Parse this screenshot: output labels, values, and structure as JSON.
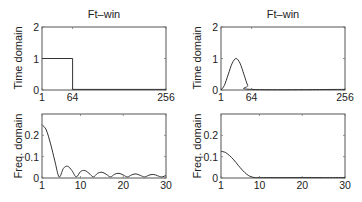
{
  "figure": {
    "columns": [
      {
        "title": "Ft–win"
      },
      {
        "title": "Ft–win"
      }
    ]
  },
  "chart_data": [
    {
      "id": "top-left",
      "type": "line",
      "title": "Ft–win",
      "xlabel": "",
      "ylabel": "Time domain",
      "xlim": [
        1,
        256
      ],
      "ylim": [
        0,
        2
      ],
      "xticks": [
        1,
        64,
        256
      ],
      "xtick_labels": [
        "1",
        "64",
        "256"
      ],
      "yticks": [
        0,
        1,
        2
      ],
      "ytick_labels": [
        "0",
        "1",
        "2"
      ],
      "grid": false,
      "series": [
        {
          "name": "rectangular window",
          "x": [
            1,
            64,
            64,
            256
          ],
          "y": [
            1,
            1,
            0.02,
            0.02
          ]
        }
      ]
    },
    {
      "id": "top-right",
      "type": "line",
      "title": "Ft–win",
      "xlabel": "",
      "ylabel": "Time domain",
      "xlim": [
        1,
        256
      ],
      "ylim": [
        0,
        2
      ],
      "xticks": [
        1,
        64,
        256
      ],
      "xtick_labels": [
        "1",
        "64",
        "256"
      ],
      "yticks": [
        0,
        1,
        2
      ],
      "ytick_labels": [
        "0",
        "1",
        "2"
      ],
      "grid": false,
      "series": [
        {
          "name": "hann window",
          "x": [
            1,
            8,
            16,
            24,
            32,
            40,
            48,
            56,
            64,
            256
          ],
          "y": [
            0.0,
            0.15,
            0.5,
            0.85,
            1.0,
            0.85,
            0.5,
            0.15,
            0.02,
            0.02
          ]
        }
      ]
    },
    {
      "id": "bottom-left",
      "type": "line",
      "title": "",
      "xlabel": "",
      "ylabel": "Freq. domain",
      "xlim": [
        1,
        30
      ],
      "ylim": [
        0,
        0.3
      ],
      "xticks": [
        1,
        10,
        20,
        30
      ],
      "xtick_labels": [
        "1",
        "10",
        "20",
        "30"
      ],
      "yticks": [
        0,
        0.1,
        0.2
      ],
      "ytick_labels": [
        "0",
        "0.1",
        "0.2"
      ],
      "grid": false,
      "series": [
        {
          "name": "rectangular spectrum",
          "x": [
            1,
            2,
            3,
            4,
            5,
            6,
            7,
            8,
            9,
            10,
            11,
            12,
            13,
            14,
            15,
            16,
            17,
            18,
            19,
            20,
            21,
            22,
            23,
            24,
            25,
            26,
            27,
            28,
            29,
            30
          ],
          "y": [
            0.25,
            0.225,
            0.16,
            0.08,
            0.005,
            0.045,
            0.055,
            0.035,
            0.005,
            0.03,
            0.035,
            0.022,
            0.005,
            0.022,
            0.027,
            0.018,
            0.005,
            0.018,
            0.022,
            0.014,
            0.005,
            0.015,
            0.019,
            0.012,
            0.005,
            0.013,
            0.017,
            0.011,
            0.005,
            0.012
          ]
        }
      ]
    },
    {
      "id": "bottom-right",
      "type": "line",
      "title": "",
      "xlabel": "",
      "ylabel": "Freq. domain",
      "xlim": [
        1,
        30
      ],
      "ylim": [
        0,
        0.3
      ],
      "xticks": [
        1,
        10,
        20,
        30
      ],
      "xtick_labels": [
        "1",
        "10",
        "20",
        "30"
      ],
      "yticks": [
        0,
        0.1,
        0.2
      ],
      "ytick_labels": [
        "0",
        "0.1",
        "0.2"
      ],
      "grid": false,
      "series": [
        {
          "name": "hann spectrum",
          "x": [
            1,
            2,
            3,
            4,
            5,
            6,
            7,
            8,
            9,
            10,
            15,
            20,
            25,
            30
          ],
          "y": [
            0.125,
            0.12,
            0.105,
            0.085,
            0.06,
            0.037,
            0.018,
            0.006,
            0.002,
            0.002,
            0.002,
            0.002,
            0.002,
            0.002
          ]
        }
      ]
    }
  ]
}
